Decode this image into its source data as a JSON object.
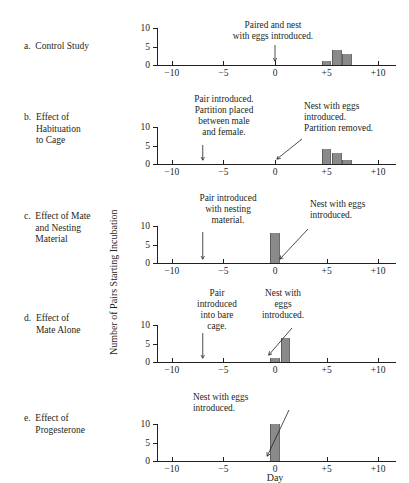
{
  "figure": {
    "xlabel": "Day",
    "ylabel": "Number of Pairs Starting Incubation"
  },
  "axis": {
    "x_ticks": [
      "−10",
      "−5",
      "0",
      "+5",
      "+10"
    ],
    "x_tick_values": [
      -10,
      -5,
      0,
      5,
      10
    ],
    "y_ticks": [
      "0",
      "5",
      "10"
    ],
    "y_tick_values": [
      0,
      5,
      10
    ],
    "xlim": [
      -11.5,
      11.7
    ],
    "ylim": [
      0,
      10
    ]
  },
  "panels": [
    {
      "id": "a",
      "letter": "a.",
      "caption": "Control Study",
      "bars": [
        {
          "x": 5,
          "y": 1
        },
        {
          "x": 6,
          "y": 4
        },
        {
          "x": 7,
          "y": 3
        }
      ],
      "annotations": [
        {
          "name": "paired-and-nest-introduced",
          "text": "Paired and nest\nwith eggs introduced.",
          "align": "center",
          "pointer": "arrow-down",
          "target_x": 0
        }
      ]
    },
    {
      "id": "b",
      "letter": "b.",
      "caption": "Effect of\nHabituation\nto Cage",
      "bars": [
        {
          "x": 5,
          "y": 4
        },
        {
          "x": 6,
          "y": 3
        },
        {
          "x": 7,
          "y": 1
        }
      ],
      "annotations": [
        {
          "name": "pair-introduced-partition-placed",
          "text": "Pair introduced.\nPartition placed\nbetween male\nand female.",
          "align": "center",
          "pointer": "arrow-down",
          "target_x": -7
        },
        {
          "name": "nest-introduced-partition-removed",
          "text": "Nest with eggs\nintroduced.\nPartition removed.",
          "align": "left",
          "pointer": "leader-line",
          "target_x": 0
        }
      ]
    },
    {
      "id": "c",
      "letter": "c.",
      "caption": "Effect of Mate\nand Nesting\nMaterial",
      "bars": [
        {
          "x": 0,
          "y": 8
        }
      ],
      "annotations": [
        {
          "name": "pair-introduced-with-nesting-material",
          "text": "Pair introduced\nwith nesting\nmaterial.",
          "align": "center",
          "pointer": "arrow-down",
          "target_x": -7
        },
        {
          "name": "nest-with-eggs-introduced",
          "text": "Nest with eggs\nintroduced.",
          "align": "left",
          "pointer": "leader-line",
          "target_x": 0.5
        }
      ]
    },
    {
      "id": "d",
      "letter": "d.",
      "caption": "Effect of\nMate Alone",
      "bars": [
        {
          "x": 0,
          "y": 1
        },
        {
          "x": 1,
          "y": 6.5
        }
      ],
      "annotations": [
        {
          "name": "pair-introduced-into-bare-cage",
          "text": "Pair\nintroduced\ninto bare\ncage.",
          "align": "center",
          "pointer": "arrow-down",
          "target_x": -7
        },
        {
          "name": "nest-with-eggs-introduced",
          "text": "Nest with\neggs\nintroduced.",
          "align": "center",
          "pointer": "leader-line",
          "target_x": -0.4
        }
      ]
    },
    {
      "id": "e",
      "letter": "e.",
      "caption": "Effect of\nProgesterone",
      "bars": [
        {
          "x": 0,
          "y": 10
        }
      ],
      "annotations": [
        {
          "name": "nest-with-eggs-introduced",
          "text": "Nest with eggs\nintroduced.",
          "align": "left",
          "pointer": "leader-line",
          "target_x": -0.6
        }
      ]
    }
  ],
  "chart_data": {
    "type": "bar",
    "title": "",
    "xlabel": "Day",
    "ylabel": "Number of Pairs Starting Incubation",
    "xlim": [
      -11.5,
      11.7
    ],
    "ylim": [
      0,
      10
    ],
    "grid": false,
    "legend": "none",
    "subplots": [
      {
        "label": "a. Control Study",
        "x": [
          5,
          6,
          7
        ],
        "values": [
          1,
          4,
          3
        ],
        "annotations": [
          "Paired and nest with eggs introduced. (day 0)"
        ]
      },
      {
        "label": "b. Effect of Habituation to Cage",
        "x": [
          5,
          6,
          7
        ],
        "values": [
          4,
          3,
          1
        ],
        "annotations": [
          "Pair introduced. Partition placed between male and female. (day −7)",
          "Nest with eggs introduced. Partition removed. (day 0)"
        ]
      },
      {
        "label": "c. Effect of Mate and Nesting Material",
        "x": [
          0
        ],
        "values": [
          8
        ],
        "annotations": [
          "Pair introduced with nesting material. (day −7)",
          "Nest with eggs introduced. (day 0)"
        ]
      },
      {
        "label": "d. Effect of Mate Alone",
        "x": [
          0,
          1
        ],
        "values": [
          1,
          6.5
        ],
        "annotations": [
          "Pair introduced into bare cage. (day −7)",
          "Nest with eggs introduced. (day 0)"
        ]
      },
      {
        "label": "e. Effect of Progesterone",
        "x": [
          0
        ],
        "values": [
          10
        ],
        "annotations": [
          "Nest with eggs introduced. (day 0)"
        ]
      }
    ]
  }
}
